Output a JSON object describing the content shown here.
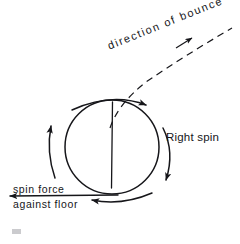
{
  "figure": {
    "title_text": "",
    "background_color": "#ffffff",
    "ink_color": "#16161a",
    "labels": {
      "direction_of_bounce": "direction of bounce",
      "right_spin": "Right spin",
      "spin_force": "spin force",
      "against_floor": "against floor"
    },
    "icons": {
      "ball": "circle-ball-shape",
      "center_line": "vertical-center-line",
      "top_arc": "curved-arrow-top-rightward",
      "right_arc": "curved-arrow-right-downward",
      "bottom_arc": "curved-arrow-bottom-leftward",
      "left_arc": "curved-arrow-left-upward",
      "bounce_path": "dashed-trajectory-arrow",
      "force_arrow": "straight-arrow-left",
      "corner_mark": "smudge-mark"
    },
    "geometry": {
      "ball_center_x": 112,
      "ball_center_y": 147,
      "ball_radius": 47,
      "rotation_direction": "clockwise"
    }
  }
}
